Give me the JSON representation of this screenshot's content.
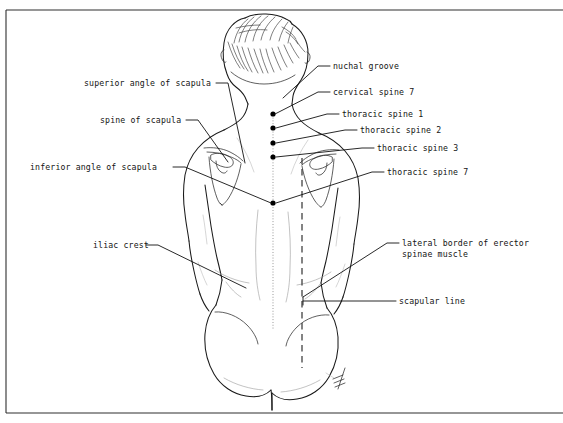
{
  "figure": {
    "view": "posterior view of human trunk",
    "ink_color": "#1a1a1a",
    "background_color": "#ffffff",
    "accent_dot_color": "#000000",
    "guide_color": "#8d8d8d"
  },
  "labels": {
    "nuchal_groove": "nuchal groove",
    "cervical_spine_7": "cervical spine 7",
    "thoracic_spine_1": "thoracic spine 1",
    "thoracic_spine_2": "thoracic spine 2",
    "thoracic_spine_3": "thoracic spine 3",
    "thoracic_spine_7": "thoracic spine 7",
    "superior_angle_of_scapula": "superior angle of scapula",
    "spine_of_scapula": "spine of scapula",
    "inferior_angle_of_scapula": "inferior angle of scapula",
    "iliac_crest": "iliac crest",
    "lateral_border_erector_line1": "lateral border of erector",
    "lateral_border_erector_line2": "spinae muscle",
    "scapular_line": "scapular line"
  },
  "landmark_points": [
    {
      "name": "cervical-spine-7",
      "x": 273,
      "y": 114
    },
    {
      "name": "thoracic-spine-1",
      "x": 273,
      "y": 128
    },
    {
      "name": "thoracic-spine-2",
      "x": 273,
      "y": 143
    },
    {
      "name": "thoracic-spine-3",
      "x": 273,
      "y": 157
    },
    {
      "name": "thoracic-spine-7",
      "x": 273,
      "y": 203
    }
  ],
  "guides": {
    "midline_label": "vertebral midline",
    "scapular_line_label": "scapular line",
    "scapular_line_x": 302,
    "scapular_line_top": 158,
    "scapular_line_bottom": 368
  }
}
